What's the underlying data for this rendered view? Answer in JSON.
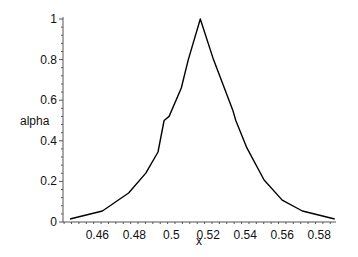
{
  "chart_data": {
    "type": "line",
    "title": "",
    "xlabel": "x",
    "ylabel": "alpha",
    "xlim": [
      0.4414,
      0.5891
    ],
    "ylim": [
      0,
      1
    ],
    "grid": false,
    "legend": null,
    "x_ticks": [
      0.46,
      0.48,
      0.5,
      0.52,
      0.54,
      0.56,
      0.58
    ],
    "x_tick_labels": [
      "0.46",
      "0.48",
      "0.5",
      "0.52",
      "0.54",
      "0.56",
      "0.58"
    ],
    "y_ticks": [
      0,
      0.2,
      0.4,
      0.6,
      0.8,
      1
    ],
    "y_tick_labels": [
      "0",
      "0.2",
      "0.4",
      "0.6",
      "0.8",
      "1"
    ],
    "series": [
      {
        "name": "alpha",
        "color": "#000000",
        "x": [
          0.4452,
          0.4627,
          0.4769,
          0.4862,
          0.4928,
          0.4961,
          0.4988,
          0.5054,
          0.5092,
          0.5157,
          0.5228,
          0.525,
          0.5332,
          0.5349,
          0.5409,
          0.5502,
          0.56,
          0.5709,
          0.5884
        ],
        "y": [
          0.015,
          0.054,
          0.143,
          0.241,
          0.345,
          0.5,
          0.52,
          0.66,
          0.8,
          1.0,
          0.8,
          0.749,
          0.552,
          0.5,
          0.365,
          0.207,
          0.108,
          0.054,
          0.015
        ]
      }
    ]
  },
  "layout": {
    "plot_left_px": 63,
    "plot_right_px": 336,
    "plot_top_px": 19,
    "plot_bottom_px": 222
  }
}
